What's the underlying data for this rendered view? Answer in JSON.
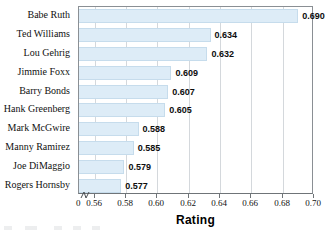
{
  "chart_data": {
    "type": "bar",
    "orientation": "horizontal",
    "title": "",
    "xlabel": "Rating",
    "ylabel": "",
    "xlim": [
      0.55,
      0.7
    ],
    "axis_break": true,
    "grid": true,
    "legend": null,
    "categories": [
      "Babe Ruth",
      "Ted Williams",
      "Lou Gehrig",
      "Jimmie Foxx",
      "Barry Bonds",
      "Hank Greenberg",
      "Mark McGwire",
      "Manny Ramirez",
      "Joe DiMaggio",
      "Rogers Hornsby"
    ],
    "values": [
      0.69,
      0.634,
      0.632,
      0.609,
      0.607,
      0.605,
      0.588,
      0.585,
      0.579,
      0.577
    ],
    "value_labels": [
      "0.690",
      "0.634",
      "0.632",
      "0.609",
      "0.607",
      "0.605",
      "0.588",
      "0.585",
      "0.579",
      "0.577"
    ],
    "xticks": [
      0.56,
      0.58,
      0.6,
      0.62,
      0.64,
      0.66,
      0.68,
      0.7
    ],
    "xtick_labels": [
      "0.56",
      "0.58",
      "0.60",
      "0.62",
      "0.64",
      "0.66",
      "0.68",
      "0.70"
    ],
    "origin_tick_label": "0",
    "bar_color": "#ddecf7",
    "bar_border_color": "#c6dcec",
    "grid_color": "#d4d8dc",
    "axis_color": "#8a8f94"
  }
}
